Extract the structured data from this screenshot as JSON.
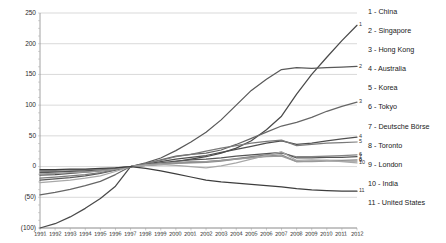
{
  "chart_data": {
    "type": "line",
    "title": "",
    "xlabel": "",
    "ylabel": "",
    "ylim": [
      -100,
      250
    ],
    "xlim": [
      1991,
      2012
    ],
    "grid": true,
    "legend_position": "right",
    "yticks": [
      "250",
      "200",
      "150",
      "100",
      "50",
      "0",
      "(50)",
      "(100)"
    ],
    "ytick_values": [
      250,
      200,
      150,
      100,
      50,
      0,
      -50,
      -100
    ],
    "x": [
      1991,
      1992,
      1993,
      1994,
      1995,
      1996,
      1997,
      1998,
      1999,
      2000,
      2001,
      2002,
      2003,
      2004,
      2005,
      2006,
      2007,
      2008,
      2009,
      2010,
      2011,
      2012
    ],
    "xticks": [
      "1991",
      "1992",
      "1993",
      "1994",
      "1995",
      "1996",
      "1997",
      "1998",
      "1999",
      "2000",
      "2001",
      "2002",
      "2003",
      "2004",
      "2005",
      "2006",
      "2007",
      "2008",
      "2009",
      "2010",
      "2011",
      "2012"
    ],
    "series": [
      {
        "name": "1 - China",
        "number": "1",
        "end_label": "1",
        "color": "#4a4a4a",
        "values": [
          -100,
          -93,
          -82,
          -68,
          -52,
          -32,
          0,
          2,
          4,
          8,
          12,
          16,
          22,
          30,
          42,
          60,
          82,
          118,
          150,
          178,
          205,
          230
        ]
      },
      {
        "name": "2 - Singapore",
        "number": "2",
        "end_label": "2",
        "color": "#595959",
        "values": [
          -22,
          -20,
          -18,
          -15,
          -11,
          -6,
          0,
          6,
          14,
          26,
          40,
          56,
          76,
          100,
          124,
          142,
          158,
          161,
          160,
          161,
          162,
          163
        ]
      },
      {
        "name": "3 - Hong Kong",
        "number": "3",
        "end_label": "3",
        "color": "#666666",
        "values": [
          -46,
          -42,
          -37,
          -31,
          -24,
          -13,
          0,
          5,
          11,
          17,
          20,
          22,
          27,
          36,
          46,
          56,
          66,
          72,
          80,
          90,
          98,
          105
        ]
      },
      {
        "name": "4 - Australia",
        "number": "4",
        "end_label": "4",
        "color": "#4f4f4f",
        "values": [
          -14,
          -13,
          -11,
          -9,
          -7,
          -4,
          0,
          4,
          8,
          12,
          15,
          18,
          23,
          28,
          33,
          38,
          42,
          36,
          38,
          42,
          45,
          48
        ]
      },
      {
        "name": "5 - Korea",
        "number": "5",
        "end_label": "5",
        "color": "#7a7a7a",
        "values": [
          -19,
          -17,
          -15,
          -13,
          -10,
          -5,
          0,
          5,
          10,
          16,
          20,
          25,
          30,
          34,
          38,
          41,
          43,
          34,
          36,
          38,
          39,
          40
        ]
      },
      {
        "name": "6 - Tokyo",
        "number": "6",
        "end_label": "6",
        "color": "#848484",
        "values": [
          -8,
          -8,
          -7,
          -6,
          -5,
          -3,
          0,
          2,
          4,
          6,
          7,
          8,
          10,
          13,
          16,
          19,
          22,
          16,
          16,
          17,
          18,
          19
        ]
      },
      {
        "name": "7 - Deutsche Börse",
        "number": "7",
        "end_label": "7",
        "color": "#555555",
        "values": [
          -10,
          -9,
          -8,
          -7,
          -5,
          -3,
          0,
          3,
          6,
          9,
          11,
          12,
          14,
          17,
          19,
          21,
          23,
          14,
          14,
          15,
          15,
          16
        ]
      },
      {
        "name": "8 - Toronto",
        "number": "8",
        "end_label": "8",
        "color": "#8c8c8c",
        "values": [
          -6,
          -6,
          -5,
          -5,
          -4,
          -2,
          0,
          2,
          3,
          5,
          6,
          7,
          9,
          12,
          15,
          17,
          19,
          8,
          9,
          10,
          10,
          11
        ]
      },
      {
        "name": "9 - London",
        "number": "9",
        "end_label": "9",
        "color": "#9a9a9a",
        "values": [
          -12,
          -11,
          -10,
          -9,
          -7,
          -4,
          0,
          3,
          5,
          7,
          8,
          8,
          10,
          12,
          14,
          16,
          17,
          8,
          8,
          9,
          9,
          9
        ]
      },
      {
        "name": "10 - India",
        "number": "10",
        "end_label": "10",
        "color": "#a8a8a8",
        "values": [
          -26,
          -24,
          -22,
          -19,
          -15,
          -8,
          0,
          2,
          3,
          2,
          0,
          -2,
          1,
          6,
          12,
          18,
          24,
          10,
          11,
          10,
          8,
          6
        ]
      },
      {
        "name": "11 - United States",
        "number": "11",
        "end_label": "11",
        "color": "#3d3d3d",
        "values": [
          -5,
          -5,
          -4,
          -4,
          -3,
          -2,
          0,
          -3,
          -7,
          -12,
          -17,
          -22,
          -25,
          -27,
          -29,
          -31,
          -33,
          -36,
          -38,
          -39,
          -40,
          -40
        ]
      }
    ]
  }
}
